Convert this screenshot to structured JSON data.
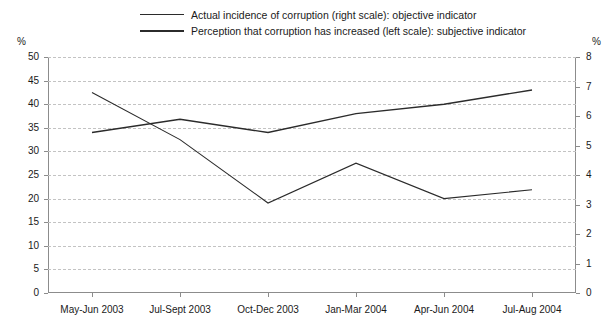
{
  "legend": {
    "items": [
      {
        "label": "Actual incidence of corruption (right scale): objective indicator",
        "weight": "thin"
      },
      {
        "label": "Perception that corruption has increased (left scale): subjective indicator",
        "weight": "thick"
      }
    ]
  },
  "axis_units": {
    "left": "%",
    "right": "%"
  },
  "chart_data": {
    "type": "line",
    "title": "",
    "xlabel": "",
    "ylabel": "%",
    "y2label": "%",
    "grid": true,
    "legend_position": "top",
    "categories": [
      "May-Jun 2003",
      "Jul-Sept 2003",
      "Oct-Dec 2003",
      "Jan-Mar 2004",
      "Apr-Jun 2004",
      "Jul-Aug 2004"
    ],
    "ylim": [
      0,
      50
    ],
    "yticks": [
      0,
      5,
      10,
      15,
      20,
      25,
      30,
      35,
      40,
      45,
      50
    ],
    "y2lim": [
      0,
      8
    ],
    "y2ticks": [
      0,
      1,
      2,
      3,
      4,
      5,
      6,
      7,
      8
    ],
    "series": [
      {
        "name": "Actual incidence of corruption (right scale): objective indicator",
        "axis": "right",
        "values": [
          6.8,
          5.2,
          3.05,
          4.4,
          3.2,
          3.5
        ]
      },
      {
        "name": "Perception that corruption has increased (left scale): subjective indicator",
        "axis": "left",
        "values": [
          34,
          36.8,
          34,
          38,
          40,
          43
        ]
      }
    ]
  }
}
